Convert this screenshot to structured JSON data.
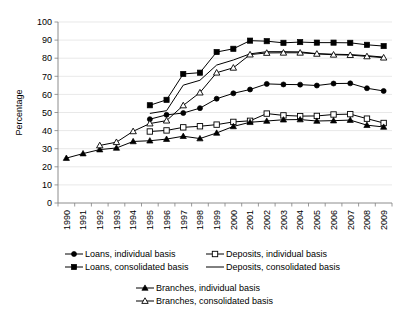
{
  "chart_data": {
    "type": "line",
    "title": "",
    "xlabel": "",
    "ylabel": "Percentage",
    "ylim": [
      0,
      100
    ],
    "ytick_step": 10,
    "yticks": [
      0,
      10,
      20,
      30,
      40,
      50,
      60,
      70,
      80,
      90,
      100
    ],
    "grid": true,
    "grid_axis": "y",
    "legend_position": "below",
    "x": [
      1990,
      1991,
      1992,
      1993,
      1994,
      1995,
      1996,
      1997,
      1998,
      1999,
      2000,
      2001,
      2002,
      2003,
      2004,
      2005,
      2006,
      2007,
      2008,
      2009
    ],
    "categories": [
      "1990",
      "1991",
      "1992",
      "1993",
      "1994",
      "1995",
      "1996",
      "1997",
      "1998",
      "1999",
      "2000",
      "2001",
      "2002",
      "2003",
      "2004",
      "2005",
      "2006",
      "2007",
      "2008",
      "2009"
    ],
    "series": [
      {
        "name": "Loans, individual basis",
        "marker": "filled-circle",
        "values": [
          null,
          null,
          null,
          null,
          null,
          46.3,
          48.7,
          49.7,
          52.4,
          57.6,
          60.6,
          62.7,
          65.8,
          65.5,
          65.4,
          64.9,
          66.0,
          66.1,
          63.4,
          61.9
        ]
      },
      {
        "name": "Loans, consolidated basis",
        "marker": "filled-square",
        "values": [
          null,
          null,
          null,
          null,
          null,
          54.0,
          57.0,
          71.3,
          72.0,
          83.4,
          85.2,
          89.7,
          89.4,
          88.5,
          88.9,
          88.6,
          88.6,
          88.5,
          87.4,
          86.7
        ]
      },
      {
        "name": "Deposits, individual basis",
        "marker": "open-square",
        "values": [
          null,
          null,
          null,
          null,
          null,
          39.5,
          40.1,
          41.8,
          42.4,
          43.3,
          44.8,
          45.4,
          49.4,
          48.4,
          48.0,
          48.1,
          48.9,
          49.1,
          46.6,
          44.2
        ]
      },
      {
        "name": "Deposits, consolidated basis",
        "marker": "none",
        "values": [
          null,
          null,
          null,
          null,
          null,
          49.5,
          51.0,
          65.1,
          67.8,
          76.2,
          79.0,
          82.4,
          83.6,
          83.6,
          83.5,
          82.5,
          82.2,
          82.0,
          81.4,
          80.6
        ]
      },
      {
        "name": "Branches, individual basis",
        "marker": "filled-triangle",
        "values": [
          24.8,
          27.3,
          29.5,
          30.4,
          34.0,
          34.4,
          35.3,
          36.9,
          35.6,
          38.7,
          42.3,
          44.6,
          45.3,
          46.0,
          46.1,
          45.3,
          45.5,
          45.8,
          43.0,
          42.0
        ]
      },
      {
        "name": "Branches, consolidated basis",
        "marker": "open-triangle",
        "values": [
          null,
          null,
          31.8,
          33.6,
          39.6,
          43.9,
          45.5,
          53.9,
          61.0,
          72.0,
          74.7,
          82.0,
          82.9,
          83.0,
          83.0,
          82.4,
          81.9,
          81.7,
          81.0,
          80.3
        ]
      }
    ]
  },
  "axes": {
    "ylabel": "Percentage",
    "ytick_labels": [
      "100",
      "90",
      "80",
      "70",
      "60",
      "50",
      "40",
      "30",
      "20",
      "10",
      "0"
    ],
    "xtick_labels": [
      "1990",
      "1991",
      "1992",
      "1993",
      "1994",
      "1995",
      "1996",
      "1997",
      "1998",
      "1999",
      "2000",
      "2001",
      "2002",
      "2003",
      "2004",
      "2005",
      "2006",
      "2007",
      "2008",
      "2009"
    ]
  },
  "legend": {
    "row1": [
      {
        "label": "Loans, individual basis",
        "marker": "filled-circle"
      },
      {
        "label": "Deposits, individual basis",
        "marker": "open-square"
      }
    ],
    "row2": [
      {
        "label": "Loans, consolidated basis",
        "marker": "filled-square"
      },
      {
        "label": "Deposits, consolidated basis",
        "marker": "none"
      }
    ],
    "row3": [
      {
        "label": "Branches, individual basis",
        "marker": "filled-triangle"
      }
    ],
    "row4": [
      {
        "label": "Branches, consolidated basis",
        "marker": "open-triangle"
      }
    ]
  },
  "colors": {
    "line": "#000000",
    "grid": "#d9d9d9",
    "axis": "#808080",
    "background": "#ffffff"
  }
}
